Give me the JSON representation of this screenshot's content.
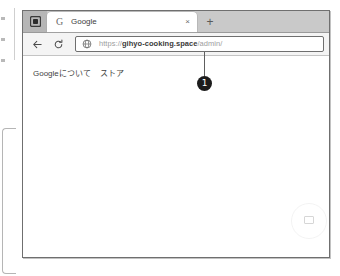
{
  "browser": {
    "tabstrip": {
      "tab_overview_icon": "tab-overview-icon",
      "tabs": [
        {
          "favicon": "G",
          "favicon_name": "google-favicon",
          "title": "Google",
          "close_label": "×"
        }
      ],
      "new_tab_label": "+"
    },
    "toolbar": {
      "back_icon": "back-arrow-icon",
      "reload_icon": "reload-icon",
      "omnibox": {
        "site_icon": "globe-icon",
        "url_scheme": "https://",
        "url_host": "gihyo-cooking.space",
        "url_path": "/admin/",
        "url_full": "https://gihyo-cooking.space/admin/"
      }
    },
    "page": {
      "links": [
        "Googleについて",
        "ストア"
      ]
    }
  },
  "annotations": {
    "callouts": [
      {
        "number": "1",
        "target": "address-bar"
      }
    ]
  }
}
